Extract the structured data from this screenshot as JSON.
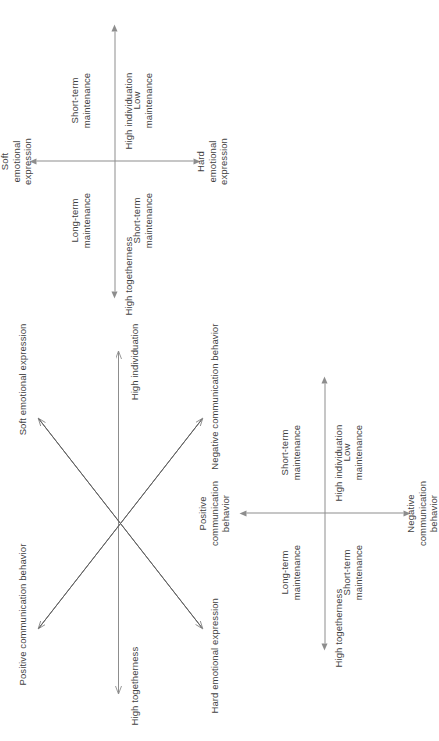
{
  "figure": {
    "orientation": "rotated-90-ccw",
    "line_color": "#8d8d8d",
    "text_color": "#3f3f3f",
    "background": "#ffffff"
  },
  "panel_cross": {
    "name": "crossing-dimensions-diagram",
    "axis_left": "High togetherness",
    "axis_right": "High individuation",
    "diag_upper_left": "Positive communication behavior",
    "diag_upper_right": "Soft emotional expression",
    "diag_lower_left": "Hard emotional expression",
    "diag_lower_right": "Negative communication behavior"
  },
  "panel_emotional": {
    "name": "emotional-expression-quadrant",
    "axis_left": "High togetherness",
    "axis_right": "High individuation",
    "axis_top": "Soft\nemotional\nexpression",
    "axis_bottom": "Hard\nemotional\nexpression",
    "quadrant_top_left": "Long-term\nmaintenance",
    "quadrant_top_right": "Short-term\nmaintenance",
    "quadrant_bottom_left": "Short-term\nmaintenance",
    "quadrant_bottom_right": "Low\nmaintenance"
  },
  "panel_communication": {
    "name": "communication-behavior-quadrant",
    "axis_left": "High togetherness",
    "axis_right": "High individuation",
    "axis_top": "Positive\ncommunication\nbehavior",
    "axis_bottom": "Negative\ncommunication\nbehavior",
    "quadrant_top_left": "Long-term\nmaintenance",
    "quadrant_top_right": "Short-term\nmaintenance",
    "quadrant_bottom_left": "Short-term\nmaintenance",
    "quadrant_bottom_right": "Low\nmaintenance"
  }
}
